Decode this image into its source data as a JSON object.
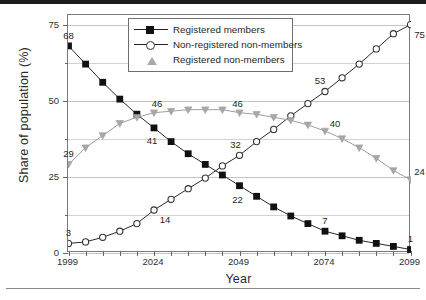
{
  "figure": {
    "y_axis_title": "Share of  population (%)",
    "x_axis_title": "Year"
  },
  "legend": {
    "items": [
      {
        "label": "Registered members",
        "marker": "filled-square",
        "color": "#111111"
      },
      {
        "label": "Non-registered non-members",
        "marker": "open-circle",
        "color": "#333333"
      },
      {
        "label": "Registered non-members",
        "marker": "gray-triangle",
        "color": "#a8a8a8"
      }
    ]
  },
  "chart_data": {
    "type": "line",
    "title": "",
    "xlabel": "Year",
    "ylabel": "Share of  population (%)",
    "xlim": [
      1999,
      2099
    ],
    "ylim": [
      0,
      78
    ],
    "grid": true,
    "legend_position": "top-center",
    "xticks": [
      1999,
      2024,
      2049,
      2074,
      2099
    ],
    "xtick_labels": [
      "1999",
      "2024",
      "2049",
      "2074",
      "2099"
    ],
    "yticks": [
      0,
      25,
      50,
      75
    ],
    "ytick_labels": [
      "0",
      "25",
      "50",
      "75"
    ],
    "minor_ytick_step": 12.5,
    "x": [
      1999,
      2004,
      2009,
      2014,
      2019,
      2024,
      2029,
      2034,
      2039,
      2044,
      2049,
      2054,
      2059,
      2064,
      2069,
      2074,
      2079,
      2084,
      2089,
      2094,
      2099
    ],
    "series": [
      {
        "name": "Registered members",
        "marker": "filled-square",
        "color": "#111111",
        "values": [
          68,
          62,
          56,
          50.5,
          45.5,
          41,
          36.5,
          32.5,
          29,
          25.5,
          22,
          18.5,
          15,
          12,
          9.5,
          7,
          5.5,
          4,
          3,
          2,
          1
        ]
      },
      {
        "name": "Non-registered non-members",
        "marker": "open-circle",
        "color": "#333333",
        "values": [
          3,
          3.5,
          5,
          7,
          9.5,
          14,
          17.5,
          21,
          24.5,
          28.5,
          32,
          36.5,
          40.5,
          45,
          49,
          53,
          57.5,
          62,
          67,
          72,
          75
        ]
      },
      {
        "name": "Registered non-members",
        "marker": "gray-triangle",
        "color": "#a8a8a8",
        "values": [
          29,
          34.5,
          38.5,
          42.5,
          44.5,
          46,
          46.5,
          47,
          47,
          47,
          46,
          45.5,
          44.5,
          43.5,
          42,
          40,
          37.5,
          34.5,
          31,
          27,
          24
        ]
      }
    ],
    "annotations": [
      {
        "text": "68",
        "x": 1999,
        "y": 68,
        "dx": 0,
        "dy": -11,
        "series": "Registered members"
      },
      {
        "text": "41",
        "x": 2024,
        "y": 41,
        "dx": -2,
        "dy": 12,
        "series": "Registered members"
      },
      {
        "text": "22",
        "x": 2049,
        "y": 22,
        "dx": -2,
        "dy": 13,
        "series": "Registered members"
      },
      {
        "text": "7",
        "x": 2074,
        "y": 7,
        "dx": 0,
        "dy": -11,
        "series": "Registered members"
      },
      {
        "text": "1",
        "x": 2099,
        "y": 1,
        "dx": 0,
        "dy": -11,
        "series": "Registered members"
      },
      {
        "text": "3",
        "x": 1999,
        "y": 3,
        "dx": 0,
        "dy": -11,
        "series": "Non-registered non-members"
      },
      {
        "text": "14",
        "x": 2024,
        "y": 14,
        "dx": 11,
        "dy": 9,
        "series": "Non-registered non-members"
      },
      {
        "text": "32",
        "x": 2049,
        "y": 32,
        "dx": -4,
        "dy": -11,
        "series": "Non-registered non-members"
      },
      {
        "text": "53",
        "x": 2074,
        "y": 53,
        "dx": -5,
        "dy": -11,
        "series": "Non-registered non-members"
      },
      {
        "text": "75",
        "x": 2099,
        "y": 75,
        "dx": 9,
        "dy": 9,
        "series": "Non-registered non-members"
      },
      {
        "text": "29",
        "x": 1999,
        "y": 29,
        "dx": 0,
        "dy": -11,
        "series": "Registered non-members"
      },
      {
        "text": "46",
        "x": 2024,
        "y": 46,
        "dx": 3,
        "dy": -10,
        "series": "Registered non-members"
      },
      {
        "text": "46",
        "x": 2049,
        "y": 46,
        "dx": -2,
        "dy": -10,
        "series": "Registered non-members"
      },
      {
        "text": "40",
        "x": 2074,
        "y": 40,
        "dx": 10,
        "dy": -8,
        "series": "Registered non-members"
      },
      {
        "text": "24",
        "x": 2099,
        "y": 24,
        "dx": 9,
        "dy": -9,
        "series": "Registered non-members"
      }
    ]
  }
}
